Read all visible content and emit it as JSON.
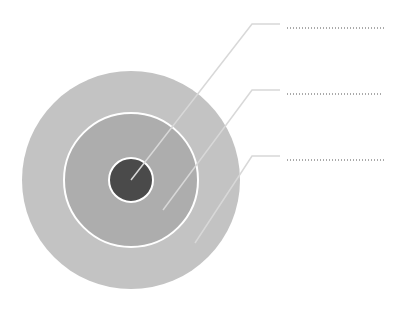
{
  "diagram": {
    "type": "concentric-circles",
    "background": "#ffffff",
    "center": [
      131,
      180
    ],
    "layers": [
      {
        "name": "outer",
        "radius": 109,
        "fill": "#c3c3c3",
        "stroke": "none"
      },
      {
        "name": "middle",
        "radius": 67,
        "fill": "#adadad",
        "stroke": "#ffffff",
        "stroke_width": 2
      },
      {
        "name": "inner",
        "radius": 22,
        "fill": "#4a4a4a",
        "stroke": "#ffffff",
        "stroke_width": 2
      }
    ],
    "leader_color": "#d8d8d8",
    "dot_color": "#555555",
    "labels": [
      {
        "target": "inner",
        "text": "",
        "anchor": [
          131,
          180
        ],
        "elbow": [
          252,
          24
        ],
        "end": [
          280,
          24
        ],
        "dots_x": [
          287,
          385
        ],
        "dots_y": 28
      },
      {
        "target": "middle",
        "text": "",
        "anchor": [
          163,
          210
        ],
        "elbow": [
          252,
          90
        ],
        "end": [
          280,
          90
        ],
        "dots_x": [
          287,
          381
        ],
        "dots_y": 94
      },
      {
        "target": "outer",
        "text": "",
        "anchor": [
          195,
          243
        ],
        "elbow": [
          252,
          156
        ],
        "end": [
          280,
          156
        ],
        "dots_x": [
          287,
          385
        ],
        "dots_y": 160
      }
    ]
  }
}
